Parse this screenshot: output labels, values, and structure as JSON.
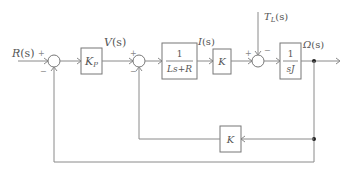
{
  "diagram": {
    "type": "block-diagram",
    "title": "",
    "signals": {
      "input": "R(s)",
      "v": "V(s)",
      "current": "I(s)",
      "disturbance": "T_L(s)",
      "output": "Ω(s)"
    },
    "signal_display": {
      "input_main": "R",
      "input_arg": "(s)",
      "v_main": "V",
      "v_arg": "(s)",
      "i_main": "I",
      "i_arg": "(s)",
      "tl_main": "T",
      "tl_sub": "L",
      "tl_arg": "(s)",
      "out_main": "Ω",
      "out_arg": "(s)"
    },
    "blocks": [
      {
        "id": "kp",
        "label_main": "K",
        "label_sub": "P"
      },
      {
        "id": "electrical",
        "numerator": "1",
        "denominator": "Ls+R"
      },
      {
        "id": "torque_const",
        "label": "K"
      },
      {
        "id": "mechanical",
        "numerator": "1",
        "denominator": "sJ"
      },
      {
        "id": "back_emf",
        "label": "K"
      }
    ],
    "summing_junctions": [
      {
        "id": "sum1",
        "signs": {
          "left": "+",
          "bottom": "−"
        }
      },
      {
        "id": "sum2",
        "signs": {
          "left": "+",
          "bottom": "−"
        }
      },
      {
        "id": "sum3",
        "signs": {
          "left": "+",
          "top": "−"
        }
      }
    ],
    "colors": {
      "line": "#8a8a8a",
      "text": "#555555",
      "background": "#ffffff"
    }
  }
}
